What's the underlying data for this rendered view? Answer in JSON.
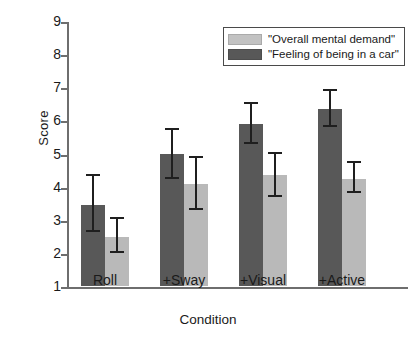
{
  "chart_data": {
    "type": "bar",
    "title": "",
    "xlabel": "Condition",
    "ylabel": "Score",
    "ylim": [
      1,
      9
    ],
    "yticks": [
      1,
      2,
      3,
      4,
      5,
      6,
      7,
      8,
      9
    ],
    "grid": false,
    "legend_position": "top-right",
    "categories": [
      "Roll",
      "+Sway",
      "+Visual",
      "+Active"
    ],
    "series": [
      {
        "name": "\"Feeling of being in a car\"",
        "color": "#585858",
        "values": [
          3.45,
          5.0,
          5.9,
          6.35
        ],
        "error_low": [
          2.62,
          4.22,
          5.3,
          5.8
        ],
        "error_high": [
          4.31,
          5.7,
          6.5,
          6.9
        ]
      },
      {
        "name": "\"Overall mental demand\"",
        "color": "#b9b9b9",
        "values": [
          2.47,
          4.07,
          4.34,
          4.22
        ],
        "error_low": [
          2.0,
          3.3,
          3.7,
          3.8
        ],
        "error_high": [
          3.01,
          4.85,
          5.0,
          4.7
        ]
      }
    ]
  },
  "axis": {
    "ylabel": "Score",
    "xlabel": "Condition",
    "ytick_labels": [
      "9",
      "8",
      "7",
      "6",
      "5",
      "4",
      "3",
      "2",
      "1"
    ],
    "xtick_labels": [
      "Roll",
      "+Sway",
      "+Visual",
      "+Active"
    ]
  },
  "legend": {
    "items": [
      {
        "label": "\"Overall mental demand\"",
        "color": "#c2c2c2"
      },
      {
        "label": "\"Feeling of being in a car\"",
        "color": "#585858"
      }
    ]
  }
}
